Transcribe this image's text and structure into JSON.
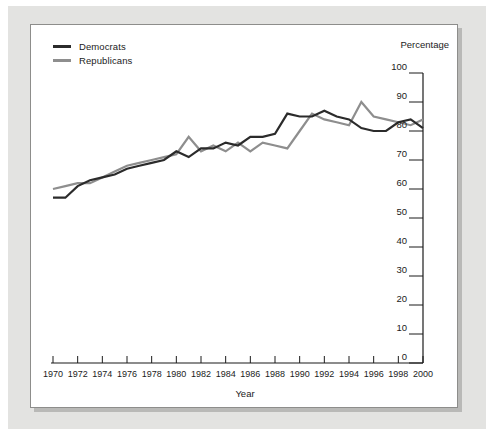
{
  "chart_data": {
    "type": "line",
    "title": "",
    "xlabel": "Year",
    "ylabel": "Percentage",
    "ylim": [
      0,
      100
    ],
    "xlim": [
      1970,
      2000
    ],
    "ytick_step": 10,
    "xtick_step": 2,
    "grid": false,
    "legend_position": "top-left",
    "yticks": [
      0,
      10,
      20,
      30,
      40,
      50,
      60,
      70,
      80,
      90,
      100
    ],
    "xticks": [
      1970,
      1972,
      1974,
      1976,
      1978,
      1980,
      1982,
      1984,
      1986,
      1988,
      1990,
      1992,
      1994,
      1996,
      1998,
      2000
    ],
    "x": [
      1970,
      1971,
      1972,
      1973,
      1974,
      1975,
      1976,
      1977,
      1978,
      1979,
      1980,
      1981,
      1982,
      1983,
      1984,
      1985,
      1986,
      1987,
      1988,
      1989,
      1990,
      1991,
      1992,
      1993,
      1994,
      1995,
      1996,
      1997,
      1998,
      1999,
      2000
    ],
    "series": [
      {
        "name": "Democrats",
        "color": "#2b2b2b",
        "values": [
          57,
          57,
          61,
          63,
          64,
          65,
          67,
          68,
          69,
          70,
          73,
          71,
          74,
          74,
          76,
          75,
          78,
          78,
          79,
          86,
          85,
          85,
          87,
          85,
          84,
          81,
          80,
          80,
          83,
          84,
          81
        ]
      },
      {
        "name": "Republicans",
        "color": "#8e8e8e",
        "values": [
          60,
          61,
          62,
          62,
          64,
          66,
          68,
          69,
          70,
          71,
          72,
          78,
          73,
          75,
          73,
          76,
          73,
          76,
          75,
          74,
          80,
          86,
          84,
          83,
          82,
          90,
          85,
          84,
          83,
          82,
          84
        ]
      }
    ]
  },
  "legend": {
    "items": [
      {
        "label": "Democrats",
        "color": "#2b2b2b"
      },
      {
        "label": "Republicans",
        "color": "#8e8e8e"
      }
    ]
  },
  "axes": {
    "y_title": "Percentage",
    "x_title": "Year"
  }
}
